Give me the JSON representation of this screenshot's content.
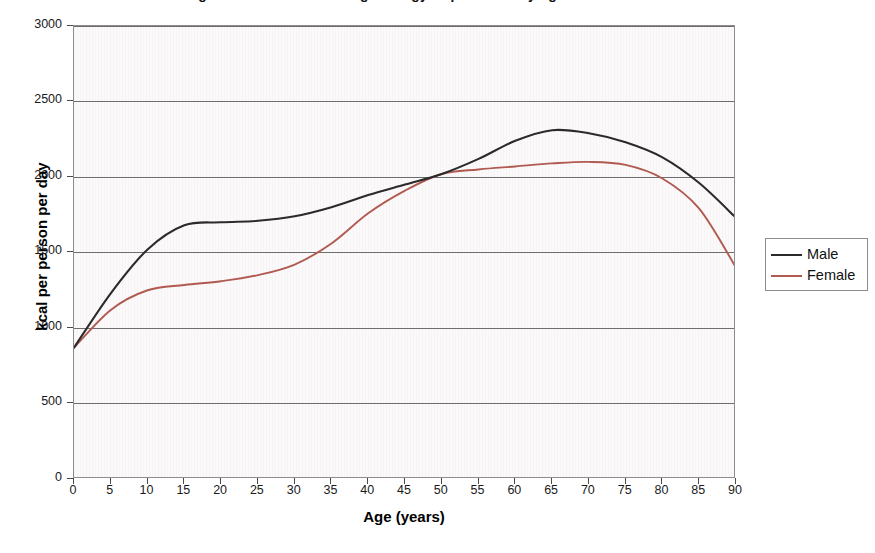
{
  "chart_data": {
    "type": "line",
    "title": "Figure 1. Estimated average energy requirement by age and sex",
    "xlabel": "Age (years)",
    "ylabel": "kcal per person per day",
    "xlim": [
      0,
      90
    ],
    "ylim": [
      0,
      3000
    ],
    "xticks": [
      0,
      5,
      10,
      15,
      20,
      25,
      30,
      35,
      40,
      45,
      50,
      55,
      60,
      65,
      70,
      75,
      80,
      85,
      90
    ],
    "yticks": [
      0,
      500,
      1000,
      1500,
      2000,
      2500,
      3000
    ],
    "grid": "horizontal",
    "legend_position": "right",
    "x": [
      0,
      5,
      10,
      15,
      20,
      25,
      30,
      35,
      40,
      45,
      50,
      55,
      60,
      65,
      70,
      75,
      80,
      85,
      90
    ],
    "series": [
      {
        "name": "Male",
        "color": "#2b2b2b",
        "values": [
          870,
          1230,
          1520,
          1680,
          1700,
          1710,
          1740,
          1800,
          1880,
          1950,
          2020,
          2120,
          2240,
          2310,
          2290,
          2230,
          2130,
          1960,
          1730
        ]
      },
      {
        "name": "Female",
        "color": "#b05a52",
        "values": [
          870,
          1120,
          1250,
          1285,
          1310,
          1350,
          1420,
          1560,
          1760,
          1910,
          2020,
          2050,
          2070,
          2090,
          2100,
          2080,
          1990,
          1790,
          1400
        ]
      }
    ]
  },
  "axes": {
    "y_labels": [
      "3000",
      "2500",
      "2000",
      "1500",
      "1000",
      "500",
      "0"
    ],
    "x_labels": [
      "0",
      "5",
      "10",
      "15",
      "20",
      "25",
      "30",
      "35",
      "40",
      "45",
      "50",
      "55",
      "60",
      "65",
      "70",
      "75",
      "80",
      "85",
      "90"
    ],
    "y_title": "kcal per person per day",
    "x_title": "Age (years)"
  },
  "legend": {
    "entries": [
      {
        "label": "Male",
        "color": "#2b2b2b"
      },
      {
        "label": "Female",
        "color": "#b05a52"
      }
    ]
  },
  "colors": {
    "male_line": "#2b2b2b",
    "female_line": "#b05a52",
    "gridline": "#6e6e6e",
    "plot_border": "#8d8d8d",
    "plot_background": "#fbf9f9"
  }
}
